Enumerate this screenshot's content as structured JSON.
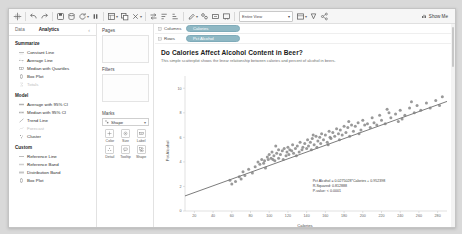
{
  "toolbar": {
    "icons": [
      "tableau-logo-icon",
      "undo-icon",
      "redo-icon",
      "save-icon",
      "new-data-source-icon",
      "refresh-data-icon",
      "pause-icon",
      "new-worksheet-icon",
      "duplicate-sheet-icon",
      "clear-sheet-icon",
      "swap-rows-cols-icon",
      "sort-ascending-icon",
      "sort-descending-icon",
      "highlight-icon",
      "group-icon",
      "show-labels-icon",
      "presentation-mode-icon",
      "fit-selector-icon",
      "fix-axes-icon",
      "format-icon",
      "share-icon"
    ],
    "fit_label": "Entire View",
    "show_me_label": "Show Me",
    "show_me_icon": "show-me-icon"
  },
  "sidebar": {
    "tabs": [
      {
        "label": "Data",
        "active": false
      },
      {
        "label": "Analytics",
        "active": true
      }
    ],
    "groups": [
      {
        "title": "Summarize",
        "items": [
          {
            "label": "Constant Line",
            "icon": "constant-line-icon",
            "disabled": false
          },
          {
            "label": "Average Line",
            "icon": "average-line-icon",
            "disabled": false
          },
          {
            "label": "Median with Quartiles",
            "icon": "median-quartiles-icon",
            "disabled": false
          },
          {
            "label": "Box Plot",
            "icon": "box-plot-icon",
            "disabled": false
          },
          {
            "label": "Totals",
            "icon": "totals-icon",
            "disabled": true
          }
        ]
      },
      {
        "title": "Model",
        "items": [
          {
            "label": "Average with 95% CI",
            "icon": "average-ci-icon",
            "disabled": false
          },
          {
            "label": "Median with 95% CI",
            "icon": "median-ci-icon",
            "disabled": false
          },
          {
            "label": "Trend Line",
            "icon": "trend-line-icon",
            "disabled": false
          },
          {
            "label": "Forecast",
            "icon": "forecast-icon",
            "disabled": true
          },
          {
            "label": "Cluster",
            "icon": "cluster-icon",
            "disabled": false
          }
        ]
      },
      {
        "title": "Custom",
        "items": [
          {
            "label": "Reference Line",
            "icon": "reference-line-icon",
            "disabled": false
          },
          {
            "label": "Reference Band",
            "icon": "reference-band-icon",
            "disabled": false
          },
          {
            "label": "Distribution Band",
            "icon": "distribution-band-icon",
            "disabled": false
          },
          {
            "label": "Box Plot",
            "icon": "box-plot-icon",
            "disabled": false
          }
        ]
      }
    ]
  },
  "cards": {
    "pages_label": "Pages",
    "filters_label": "Filters",
    "marks_label": "Marks",
    "marks_type": "Shape",
    "marks_type_icon": "shape-mark-icon",
    "marks_caret": "chevron-down-icon",
    "mark_buttons": [
      {
        "label": "Color",
        "icon": "color-icon"
      },
      {
        "label": "Size",
        "icon": "size-icon"
      },
      {
        "label": "Label",
        "icon": "label-icon"
      },
      {
        "label": "Detail",
        "icon": "detail-icon"
      },
      {
        "label": "Tooltip",
        "icon": "tooltip-icon"
      },
      {
        "label": "Shape",
        "icon": "shape-icon"
      }
    ]
  },
  "shelves": {
    "columns_label": "Columns",
    "columns_pill": "Calories",
    "rows_label": "Rows",
    "rows_pill": "Pct Alcohol",
    "pill_color": "#8fb8c4"
  },
  "viz": {
    "title": "Do Calories Affect Alcohol Content in Beer?",
    "subtitle": "This simple scatterplot shows the linear relationship between calories and percent of alcohol in beers.",
    "annotation": {
      "equation": "Pct Alcohol = 0.0275028*Calories + 0.952398",
      "r_squared": "R-Squared: 0.812888",
      "p_value": "P-value: < 0.0001"
    }
  },
  "chart_data": {
    "type": "scatter",
    "title": "Do Calories Affect Alcohol Content in Beer?",
    "subtitle": "This simple scatterplot shows the linear relationship between calories and percent of alcohol in beers.",
    "xlabel": "Calories",
    "ylabel": "Pct Alcohol",
    "xlim": [
      10,
      290
    ],
    "ylim": [
      0,
      11
    ],
    "xticks": [
      20,
      40,
      60,
      80,
      100,
      120,
      140,
      160,
      180,
      200,
      220,
      240,
      260,
      280
    ],
    "yticks": [
      0,
      2,
      4,
      6,
      8,
      10
    ],
    "grid": false,
    "legend": "none",
    "marker_color": "#7f7f7f",
    "trend_line": {
      "slope": 0.0275028,
      "intercept": 0.952398,
      "r_squared": 0.812888,
      "p_value": "< 0.0001",
      "color": "#5a5a5a"
    },
    "points": [
      [
        64,
        2.4
      ],
      [
        68,
        2.8
      ],
      [
        70,
        2.6
      ],
      [
        72,
        3.2
      ],
      [
        74,
        2.9
      ],
      [
        78,
        3.4
      ],
      [
        82,
        3.1
      ],
      [
        85,
        3.6
      ],
      [
        88,
        4.0
      ],
      [
        90,
        3.8
      ],
      [
        92,
        4.2
      ],
      [
        95,
        4.1
      ],
      [
        96,
        3.5
      ],
      [
        98,
        4.4
      ],
      [
        99,
        4.2
      ],
      [
        100,
        4.6
      ],
      [
        102,
        4.3
      ],
      [
        103,
        4.8
      ],
      [
        104,
        4.2
      ],
      [
        105,
        4.5
      ],
      [
        106,
        4.1
      ],
      [
        108,
        4.7
      ],
      [
        110,
        4.3
      ],
      [
        110,
        5.0
      ],
      [
        112,
        4.6
      ],
      [
        114,
        4.9
      ],
      [
        115,
        4.2
      ],
      [
        116,
        5.1
      ],
      [
        118,
        4.5
      ],
      [
        119,
        4.8
      ],
      [
        120,
        5.2
      ],
      [
        121,
        4.6
      ],
      [
        122,
        5.0
      ],
      [
        124,
        4.9
      ],
      [
        125,
        5.4
      ],
      [
        126,
        4.7
      ],
      [
        128,
        5.1
      ],
      [
        130,
        5.3
      ],
      [
        132,
        4.8
      ],
      [
        133,
        5.6
      ],
      [
        135,
        5.0
      ],
      [
        136,
        5.2
      ],
      [
        138,
        5.5
      ],
      [
        140,
        5.1
      ],
      [
        141,
        5.8
      ],
      [
        142,
        5.3
      ],
      [
        144,
        5.6
      ],
      [
        145,
        5.0
      ],
      [
        146,
        5.9
      ],
      [
        148,
        5.4
      ],
      [
        150,
        6.1
      ],
      [
        151,
        5.2
      ],
      [
        152,
        5.7
      ],
      [
        154,
        6.0
      ],
      [
        155,
        5.5
      ],
      [
        156,
        6.3
      ],
      [
        158,
        5.8
      ],
      [
        160,
        6.2
      ],
      [
        162,
        5.6
      ],
      [
        164,
        6.5
      ],
      [
        165,
        6.0
      ],
      [
        166,
        5.9
      ],
      [
        168,
        6.4
      ],
      [
        170,
        6.1
      ],
      [
        172,
        6.7
      ],
      [
        174,
        6.3
      ],
      [
        175,
        5.8
      ],
      [
        176,
        6.6
      ],
      [
        178,
        6.2
      ],
      [
        180,
        6.9
      ],
      [
        182,
        6.4
      ],
      [
        184,
        6.8
      ],
      [
        186,
        6.1
      ],
      [
        188,
        7.0
      ],
      [
        190,
        6.5
      ],
      [
        192,
        6.9
      ],
      [
        195,
        7.2
      ],
      [
        198,
        6.6
      ],
      [
        200,
        7.4
      ],
      [
        202,
        7.0
      ],
      [
        205,
        7.1
      ],
      [
        208,
        6.8
      ],
      [
        210,
        7.6
      ],
      [
        212,
        7.2
      ],
      [
        215,
        7.0
      ],
      [
        218,
        7.8
      ],
      [
        220,
        7.4
      ],
      [
        224,
        7.1
      ],
      [
        228,
        8.0
      ],
      [
        230,
        7.6
      ],
      [
        235,
        7.9
      ],
      [
        238,
        7.3
      ],
      [
        240,
        8.2
      ],
      [
        245,
        7.8
      ],
      [
        250,
        8.4
      ],
      [
        255,
        8.0
      ],
      [
        258,
        8.6
      ],
      [
        262,
        8.2
      ],
      [
        268,
        8.8
      ],
      [
        272,
        8.4
      ],
      [
        278,
        9.0
      ],
      [
        282,
        8.6
      ],
      [
        285,
        9.3
      ],
      [
        60,
        2.2
      ],
      [
        58,
        2.5
      ],
      [
        94,
        3.9
      ],
      [
        107,
        5.3
      ],
      [
        129,
        4.5
      ],
      [
        147,
        6.2
      ],
      [
        163,
        5.4
      ],
      [
        185,
        7.3
      ],
      [
        196,
        6.3
      ],
      [
        226,
        8.3
      ],
      [
        242,
        7.5
      ],
      [
        252,
        8.9
      ]
    ]
  }
}
